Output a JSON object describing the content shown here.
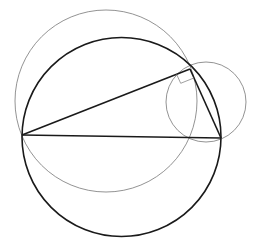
{
  "diagram": {
    "colors": {
      "thick": "#1a1a1a",
      "thin": "#777777",
      "background": "#ffffff"
    },
    "points": {
      "A": {
        "x": 22,
        "y": 135
      },
      "B": {
        "x": 221,
        "y": 138
      },
      "C": {
        "x": 190,
        "y": 69
      }
    },
    "circles": [
      {
        "name": "circumcircle",
        "cx": 121.5,
        "cy": 137,
        "r": 99.5,
        "style": "thick"
      },
      {
        "name": "large-thin-circle",
        "cx": 106,
        "cy": 101,
        "r": 91,
        "style": "thin"
      },
      {
        "name": "small-thin-circle",
        "cx": 206,
        "cy": 102,
        "r": 40,
        "style": "thin"
      }
    ],
    "right_angle_at": "C"
  }
}
